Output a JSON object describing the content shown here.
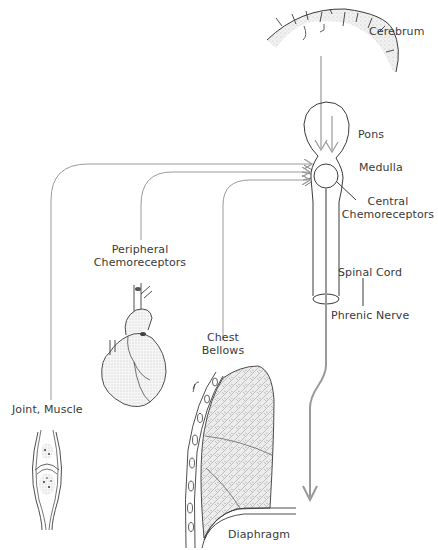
{
  "diagram": {
    "type": "respiratory-control-schematic",
    "labels": {
      "cerebrum": "Cerebrum",
      "pons": "Pons",
      "medulla": "Medulla",
      "central_chemoreceptors_line1": "Central",
      "central_chemoreceptors_line2": "Chemoreceptors",
      "peripheral_chemoreceptors_line1": "Peripheral",
      "peripheral_chemoreceptors_line2": "Chemoreceptors",
      "spinal_cord": "Spinal Cord",
      "phrenic_nerve": "Phrenic Nerve",
      "chest_bellows_line1": "Chest",
      "chest_bellows_line2": "Bellows",
      "joint_muscle": "Joint, Muscle",
      "diaphragm": "Diaphragm"
    },
    "structures": [
      {
        "name": "cerebrum",
        "depiction": "brain cortex cross-section"
      },
      {
        "name": "pons",
        "depiction": "oval brainstem outline"
      },
      {
        "name": "medulla",
        "depiction": "circle"
      },
      {
        "name": "spinal-cord",
        "depiction": "tube"
      },
      {
        "name": "heart",
        "depiction": "heart illustration"
      },
      {
        "name": "lung",
        "depiction": "lung with rib cage"
      },
      {
        "name": "joint",
        "depiction": "joint/muscle illustration"
      },
      {
        "name": "diaphragm",
        "depiction": "curved muscle"
      }
    ],
    "connections": [
      {
        "from": "Cerebrum",
        "to": "Pons",
        "kind": "arrow"
      },
      {
        "from": "Pons",
        "to": "Medulla",
        "kind": "arrow"
      },
      {
        "from": "Joint, Muscle",
        "to": "Medulla",
        "kind": "arrow"
      },
      {
        "from": "Peripheral Chemoreceptors",
        "to": "Medulla",
        "kind": "arrow"
      },
      {
        "from": "Chest Bellows",
        "to": "Medulla",
        "kind": "arrow"
      },
      {
        "from": "Spinal Cord",
        "to": "Diaphragm",
        "via": "Phrenic Nerve",
        "kind": "arrow"
      }
    ],
    "colors": {
      "pathway": "#9a9a9a",
      "outline": "#3a3a3a",
      "label": "#3a3a3a"
    }
  }
}
